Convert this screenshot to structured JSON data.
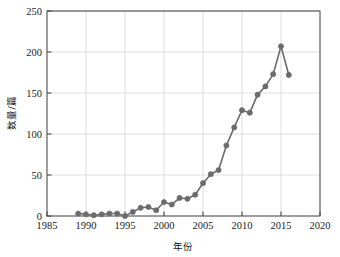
{
  "chart_data": {
    "type": "line",
    "title": "",
    "subtitle": "",
    "xlabel": "年份",
    "ylabel": "数量/篇",
    "xlim": [
      1985,
      2020
    ],
    "ylim": [
      0,
      250
    ],
    "xticks": [
      1985,
      1990,
      1995,
      2000,
      2005,
      2010,
      2015,
      2020
    ],
    "yticks": [
      0,
      50,
      100,
      150,
      200,
      250
    ],
    "grid": true,
    "legend": null,
    "legend_position": "none",
    "marker": "circle",
    "series_color": "#6b6b6b",
    "x": [
      1989,
      1990,
      1991,
      1992,
      1993,
      1994,
      1995,
      1996,
      1997,
      1998,
      1999,
      2000,
      2001,
      2002,
      2003,
      2004,
      2005,
      2006,
      2007,
      2008,
      2009,
      2010,
      2011,
      2012,
      2013,
      2014,
      2015,
      2016
    ],
    "values": [
      3,
      2,
      1,
      2,
      3,
      3,
      0,
      5,
      10,
      11,
      7,
      17,
      14,
      22,
      21,
      26,
      40,
      51,
      56,
      86,
      108,
      129,
      126,
      148,
      158,
      173,
      207,
      172
    ],
    "annotations": []
  },
  "axis": {
    "y_tick_labels": [
      "250",
      "200",
      "150",
      "100",
      "50",
      "0"
    ],
    "x_tick_labels": [
      "1985",
      "1990",
      "1995",
      "2000",
      "2005",
      "2010",
      "2015",
      "2020"
    ],
    "x_title": "年份",
    "y_title": "数量/篇"
  },
  "colors": {
    "series": "#6b6b6b",
    "grid": "#d6d6d6",
    "axis": "#4d4d4d",
    "text": "#1a1a1a",
    "background": "#ffffff"
  }
}
